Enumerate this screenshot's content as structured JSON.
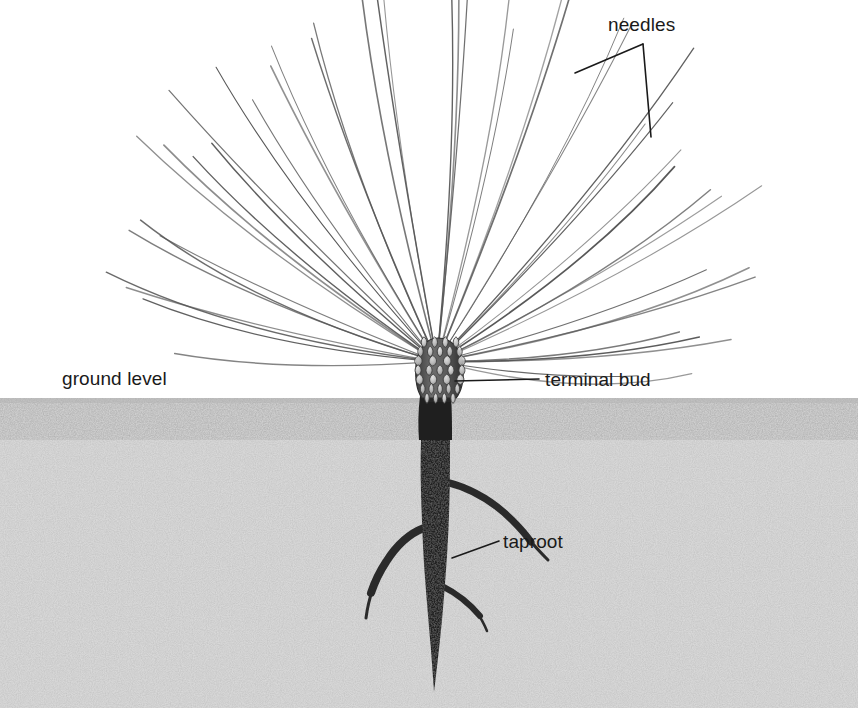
{
  "figure": {
    "kind": "botanical-illustration",
    "width": 858,
    "height": 708,
    "background_color": "#ffffff",
    "soil_color": "#d8d8d8",
    "soil_speckle_color": "#8a8a8a",
    "needle_color": "#555555",
    "root_color": "#262626",
    "bud_fill_color": "#c9c9c9",
    "bud_outline_color": "#3a3a3a",
    "leader_line_color": "#1a1a1a",
    "text_color": "#1a1a1a",
    "ground_level_y": 398,
    "needle_origin": {
      "x": 437,
      "y": 362
    }
  },
  "labels": {
    "needles": "needles",
    "ground_level": "ground level",
    "terminal_bud": "terminal bud",
    "taproot": "taproot"
  },
  "leaders": {
    "needles": {
      "apex": {
        "x": 643,
        "y": 44
      },
      "branch_left_end": {
        "x": 575,
        "y": 73
      },
      "branch_down_end": {
        "x": 651,
        "y": 137
      }
    },
    "terminal_bud": {
      "start": {
        "x": 455,
        "y": 381
      },
      "end": {
        "x": 539,
        "y": 379
      }
    },
    "taproot": {
      "start": {
        "x": 452,
        "y": 558
      },
      "end": {
        "x": 499,
        "y": 541
      }
    }
  },
  "structures": {
    "terminal_bud": {
      "name": "terminal bud",
      "center": {
        "x": 440,
        "y": 371
      },
      "width": 42,
      "height": 62,
      "scale_rows": 7,
      "scales_per_row": 4
    },
    "stem": {
      "name": "stem",
      "top_y": 392,
      "bottom_y": 430,
      "width": 26
    },
    "taproot": {
      "name": "taproot",
      "top_y": 398,
      "tip_y": 692,
      "max_width": 30,
      "lateral_roots": [
        {
          "side": "right",
          "y": 487,
          "length": 72
        },
        {
          "side": "left",
          "y": 534,
          "length": 68
        },
        {
          "side": "right",
          "y": 592,
          "length": 60
        }
      ]
    },
    "needle_fan": {
      "name": "needle fan",
      "count": 46,
      "angle_range_degrees": [
        -3,
        183
      ],
      "length_range": [
        170,
        380
      ]
    }
  },
  "chart_data": {
    "type": "scatter",
    "annotations": [
      "needles",
      "ground level",
      "terminal bud",
      "taproot"
    ]
  }
}
